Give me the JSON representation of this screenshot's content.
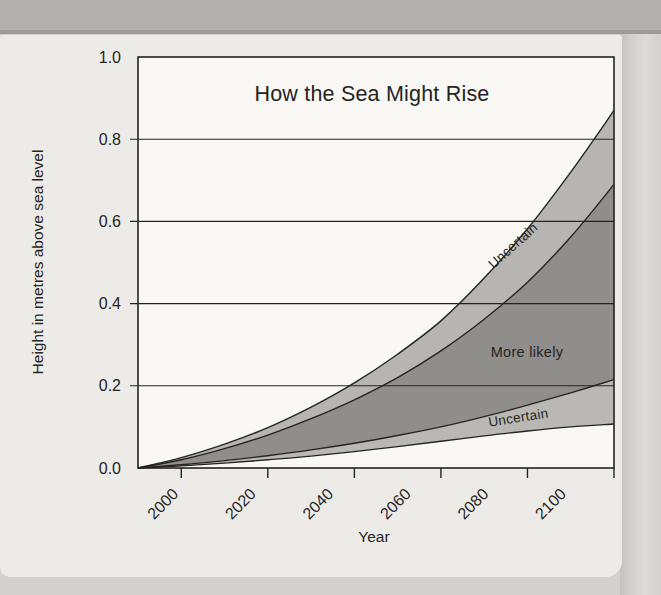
{
  "page": {
    "colors": {
      "page_bg": "#d3d1cd",
      "top_band_bg": "#b2b0ac",
      "top_band_edge": "#9c9a96",
      "panel_bg": "#ecebe7",
      "right_edge_dark": "#c5c3bf",
      "right_edge_light": "#dedcd8",
      "ink": "#26241f"
    }
  },
  "chart_data": {
    "type": "area",
    "title": "How the Sea Might Rise",
    "xlabel": "Year",
    "ylabel": "Height in metres above sea level",
    "xlim": [
      1990,
      2100
    ],
    "ylim": [
      0,
      1
    ],
    "grid": "horizontal",
    "legend": "none",
    "x_ticks": [
      2000,
      2020,
      2040,
      2060,
      2080,
      2100
    ],
    "y_ticks": {
      "values": [
        1.0,
        0.8,
        0.6,
        0.4,
        0.2,
        0.0
      ],
      "labels": [
        "1.0",
        "0.8",
        "0.6",
        "0.4",
        "0.2",
        "0.0"
      ]
    },
    "years": [
      1990,
      2000,
      2010,
      2020,
      2030,
      2040,
      2050,
      2060,
      2070,
      2080,
      2090,
      2100
    ],
    "series": {
      "upper_bound": [
        0,
        0.025,
        0.058,
        0.098,
        0.148,
        0.207,
        0.277,
        0.358,
        0.462,
        0.582,
        0.72,
        0.87
      ],
      "more_likely_upper": [
        0,
        0.02,
        0.047,
        0.08,
        0.12,
        0.166,
        0.22,
        0.285,
        0.362,
        0.452,
        0.562,
        0.69
      ],
      "more_likely_lower": [
        0,
        0.008,
        0.018,
        0.03,
        0.044,
        0.06,
        0.079,
        0.1,
        0.125,
        0.153,
        0.183,
        0.215
      ],
      "lower_bound": [
        0,
        0.005,
        0.012,
        0.02,
        0.029,
        0.04,
        0.052,
        0.065,
        0.078,
        0.09,
        0.1,
        0.107
      ]
    },
    "bands": [
      {
        "label": "Uncertain",
        "top": "upper_bound",
        "bottom": "more_likely_upper",
        "color": "#b6b5b1"
      },
      {
        "label": "More likely",
        "top": "more_likely_upper",
        "bottom": "more_likely_lower",
        "color": "#8f8e8a"
      },
      {
        "label": "Uncertain",
        "top": "more_likely_lower",
        "bottom": "lower_bound",
        "color": "#b9b8b4"
      }
    ],
    "colors": {
      "plot_bg": "#f9f8f4",
      "line": "#26241f",
      "uncertain_band": "#b6b5b1",
      "more_likely_band": "#8f8e8a"
    }
  }
}
